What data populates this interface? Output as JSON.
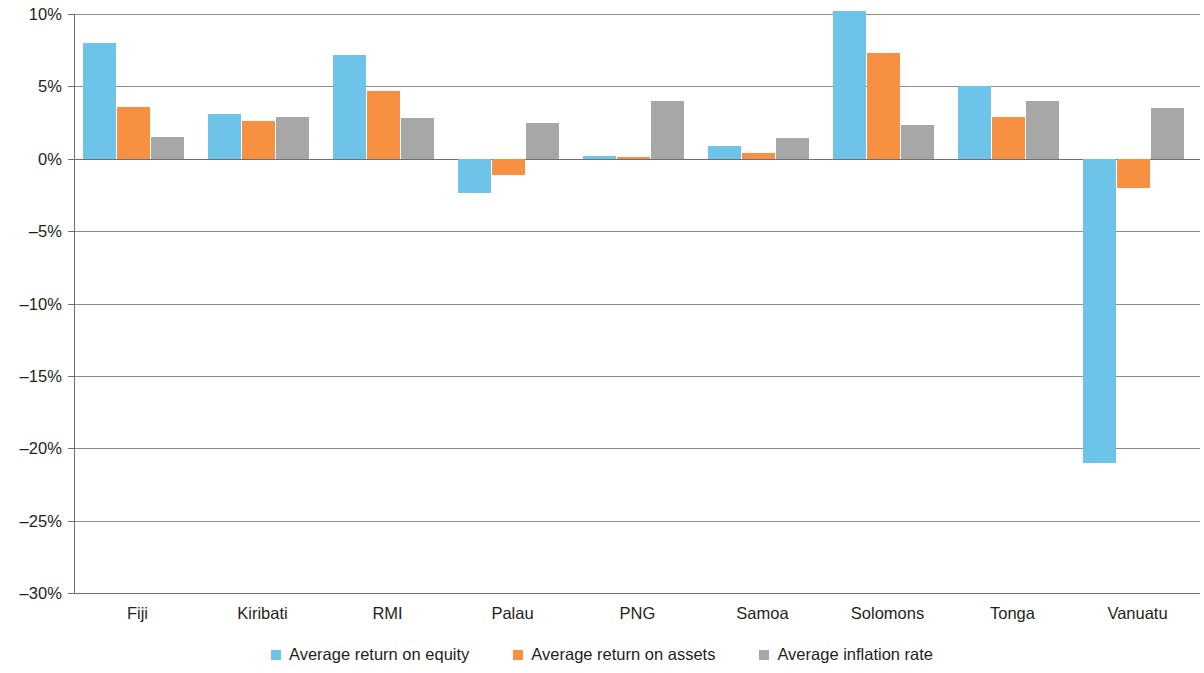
{
  "chart_data": {
    "type": "bar",
    "title": "",
    "subtitle": "",
    "xlabel": "",
    "ylabel": "",
    "categories": [
      "Fiji",
      "Kiribati",
      "RMI",
      "Palau",
      "PNG",
      "Samoa",
      "Solomons",
      "Tonga",
      "Vanuatu"
    ],
    "series": [
      {
        "name": "Average return on equity",
        "color": "#6ec3e8",
        "values": [
          8.0,
          3.1,
          7.2,
          -2.4,
          0.2,
          0.9,
          10.2,
          5.0,
          -21.0
        ]
      },
      {
        "name": "Average return on assets",
        "color": "#f79041",
        "values": [
          3.6,
          2.6,
          4.7,
          -1.1,
          0.1,
          0.4,
          7.3,
          2.9,
          -2.0
        ]
      },
      {
        "name": "Average inflation rate",
        "color": "#a7a7a7",
        "values": [
          1.5,
          2.9,
          2.8,
          2.5,
          4.0,
          1.4,
          2.3,
          4.0,
          3.5
        ]
      }
    ],
    "ylim": [
      -30,
      10
    ],
    "y_ticks": [
      10,
      5,
      0,
      -5,
      -10,
      -15,
      -20,
      -25,
      -30
    ],
    "y_tick_labels": [
      "10%",
      "5%",
      "0%",
      "–5%",
      "–10%",
      "–15%",
      "–20%",
      "–25%",
      "–30%"
    ],
    "y_tick_format": "percent",
    "grid": true,
    "grid_axis": "y",
    "legend_position": "bottom",
    "annotations": []
  }
}
